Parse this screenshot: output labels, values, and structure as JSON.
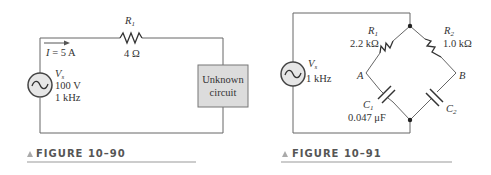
{
  "figures": [
    {
      "caption": "FIGURE 10–90",
      "source": {
        "name": "V",
        "sub": "s",
        "voltage": "100 V",
        "frequency": "1 kHz"
      },
      "current": {
        "label": "I",
        "value": "= 5 A"
      },
      "resistor": {
        "name": "R",
        "sub": "1",
        "value": "4 Ω"
      },
      "box": {
        "line1": "Unknown",
        "line2": "circuit"
      }
    },
    {
      "caption": "FIGURE 10–91",
      "source": {
        "name": "V",
        "sub": "s",
        "frequency": "1 kHz"
      },
      "r1": {
        "name": "R",
        "sub": "1",
        "value": "2.2 kΩ"
      },
      "r2": {
        "name": "R",
        "sub": "2",
        "value": "1.0 kΩ"
      },
      "c1": {
        "name": "C",
        "sub": "1",
        "value": "0.047 μF"
      },
      "c2": {
        "name": "C",
        "sub": "2"
      },
      "nodes": {
        "a": "A",
        "b": "B"
      }
    }
  ],
  "colors": {
    "wire": "#666666",
    "box_fill": "#dcdcdc",
    "source_fill": "#e6e6e6",
    "caption_rule": "#999999"
  }
}
